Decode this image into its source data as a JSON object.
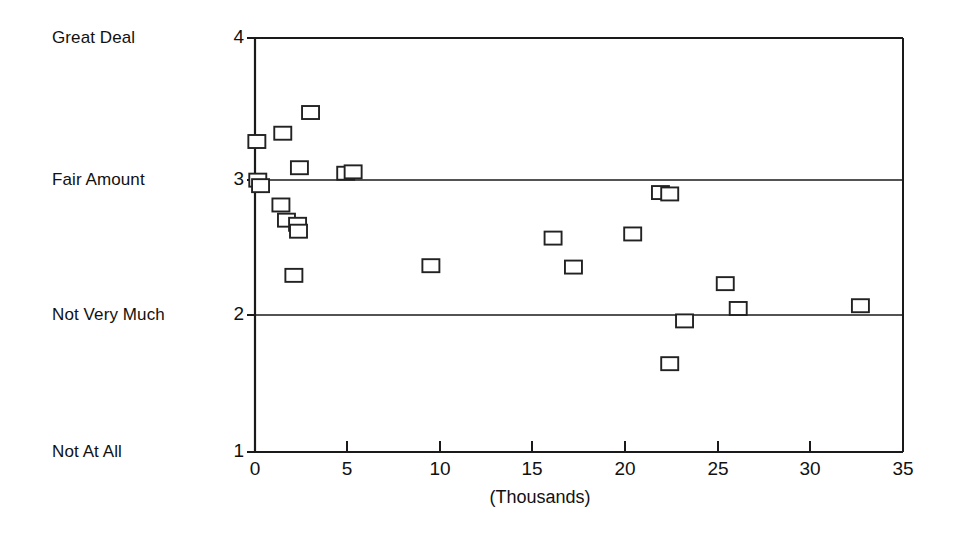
{
  "chart_data": {
    "type": "scatter",
    "title": "",
    "xlabel": "(Thousands)",
    "ylabel": "",
    "xlim": [
      0,
      35
    ],
    "ylim": [
      1,
      4
    ],
    "grid": "horizontal-at-y2-and-y3",
    "legend": "none",
    "marker": "open-square",
    "x_ticks": [
      0,
      5,
      10,
      15,
      20,
      25,
      30,
      35
    ],
    "x_tick_labels": [
      "0",
      "5",
      "10",
      "15",
      "20",
      "25",
      "30",
      "35"
    ],
    "y_ticks": [
      1,
      2,
      3,
      4
    ],
    "y_tick_labels": [
      "1",
      "2",
      "3",
      "4"
    ],
    "y_category_labels": [
      {
        "value": 4,
        "label": "Great Deal"
      },
      {
        "value": 3,
        "label": "Fair Amount"
      },
      {
        "value": 2,
        "label": "Not Very Much"
      },
      {
        "value": 1,
        "label": "Not At All"
      }
    ],
    "points": [
      {
        "x": 0.1,
        "y": 3.25
      },
      {
        "x": 0.15,
        "y": 2.97
      },
      {
        "x": 0.3,
        "y": 2.93
      },
      {
        "x": 1.5,
        "y": 3.31
      },
      {
        "x": 1.4,
        "y": 2.79
      },
      {
        "x": 1.7,
        "y": 2.68
      },
      {
        "x": 2.4,
        "y": 3.06
      },
      {
        "x": 2.3,
        "y": 2.65
      },
      {
        "x": 2.35,
        "y": 2.6
      },
      {
        "x": 2.1,
        "y": 2.28
      },
      {
        "x": 3.0,
        "y": 3.46
      },
      {
        "x": 4.9,
        "y": 3.02
      },
      {
        "x": 5.3,
        "y": 3.03
      },
      {
        "x": 9.5,
        "y": 2.35
      },
      {
        "x": 16.1,
        "y": 2.55
      },
      {
        "x": 17.2,
        "y": 2.34
      },
      {
        "x": 20.4,
        "y": 2.58
      },
      {
        "x": 21.9,
        "y": 2.88
      },
      {
        "x": 22.4,
        "y": 2.87
      },
      {
        "x": 23.2,
        "y": 1.95
      },
      {
        "x": 22.4,
        "y": 1.64
      },
      {
        "x": 25.4,
        "y": 2.22
      },
      {
        "x": 26.1,
        "y": 2.04
      },
      {
        "x": 32.7,
        "y": 2.06
      }
    ]
  },
  "colors": {
    "axis": "#1a1a1a",
    "marker_stroke": "#222222",
    "marker_fill": "#ffffff",
    "text": "#111111",
    "background": "#ffffff"
  }
}
